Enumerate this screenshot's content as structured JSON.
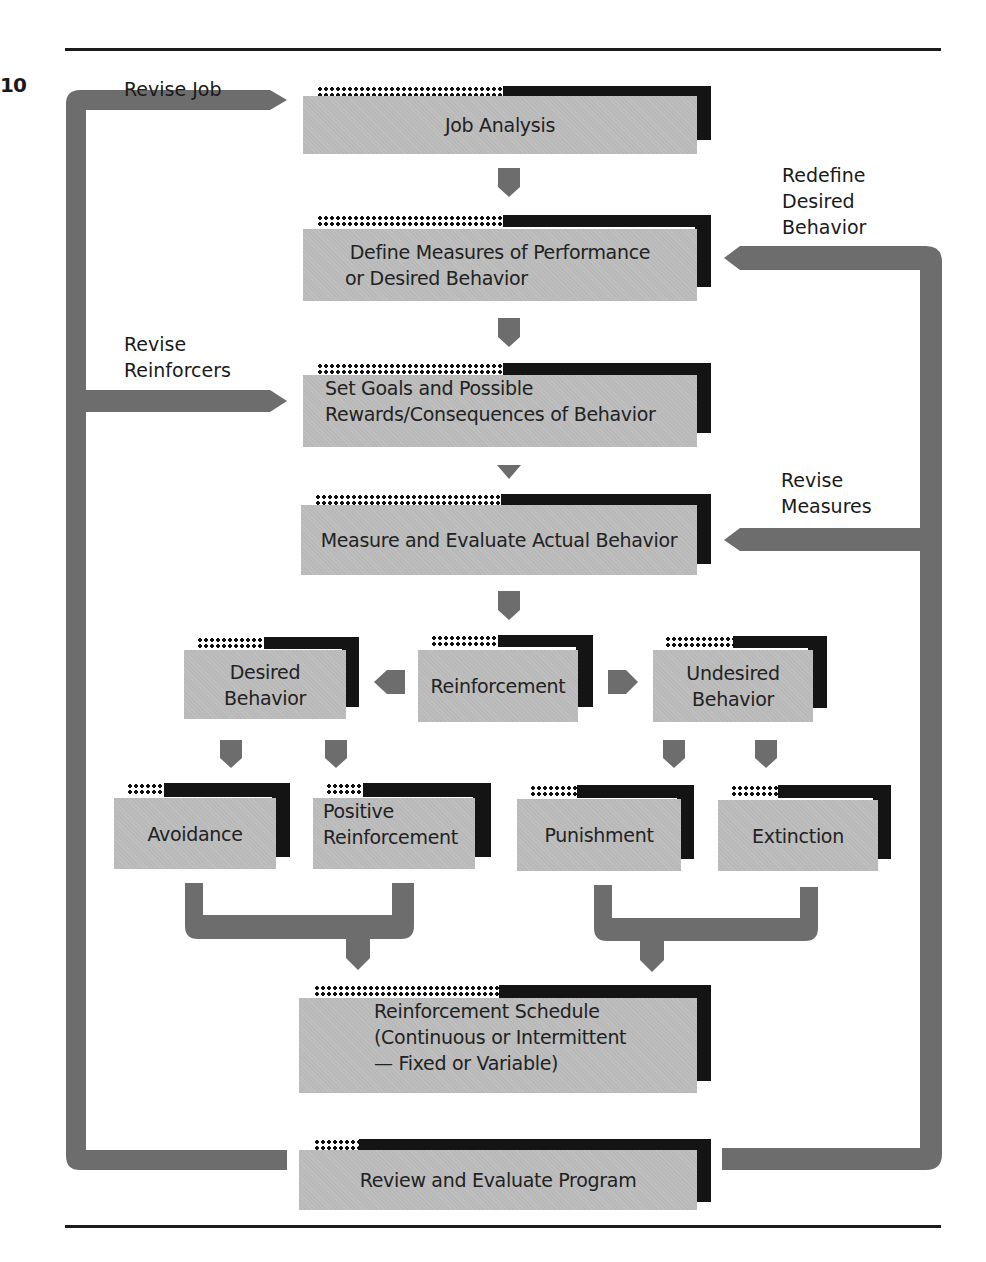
{
  "figure": {
    "number": "10"
  },
  "feedback_labels": {
    "revise_job": "Revise Job",
    "redefine_desired_behavior": [
      "Redefine",
      "Desired",
      "Behavior"
    ],
    "revise_reinforcers": [
      "Revise",
      "Reinforcers"
    ],
    "revise_measures": [
      "Revise",
      "Measures"
    ]
  },
  "boxes": {
    "job_analysis": [
      "Job Analysis"
    ],
    "define_measures": [
      "Define Measures of Performance",
      "or Desired Behavior"
    ],
    "set_goals": [
      "Set Goals and Possible",
      "Rewards/Consequences of Behavior"
    ],
    "measure_evaluate": [
      "Measure and Evaluate Actual Behavior"
    ],
    "desired_behavior": [
      "Desired",
      "Behavior"
    ],
    "reinforcement": [
      "Reinforcement"
    ],
    "undesired_behavior": [
      "Undesired",
      "Behavior"
    ],
    "avoidance": [
      "Avoidance"
    ],
    "positive_reinforcement": [
      "Positive",
      "Reinforcement"
    ],
    "punishment": [
      "Punishment"
    ],
    "extinction": [
      "Extinction"
    ],
    "reinforcement_schedule": [
      "Reinforcement Schedule",
      "(Continuous or Intermittent",
      "— Fixed or Variable)"
    ],
    "review_evaluate": [
      "Review and Evaluate Program"
    ]
  },
  "colors": {
    "box_face": "#b9b9b9",
    "box_shadow": "#141414",
    "arrow": "#6d6d6d",
    "rule": "#1c1c1c"
  }
}
